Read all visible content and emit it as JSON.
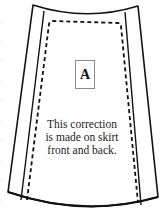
{
  "diagram": {
    "piece_label": "A",
    "note_lines": [
      "This correction",
      "is made on skirt",
      "front and back."
    ],
    "colors": {
      "outline": "#111111",
      "label_border": "#8a8a8a",
      "text": "#222222",
      "background": "#ffffff"
    }
  }
}
